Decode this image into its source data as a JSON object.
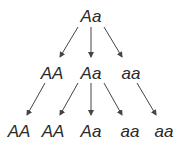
{
  "diagram": {
    "type": "genotype-inheritance-tree",
    "levels": [
      {
        "level": 0,
        "nodes": [
          {
            "id": "n0",
            "label": "Aa",
            "x": 91,
            "y": 8
          }
        ]
      },
      {
        "level": 1,
        "nodes": [
          {
            "id": "n1",
            "label": "AA",
            "x": 52,
            "y": 65
          },
          {
            "id": "n2",
            "label": "Aa",
            "x": 91,
            "y": 65
          },
          {
            "id": "n3",
            "label": "aa",
            "x": 131,
            "y": 65
          }
        ]
      },
      {
        "level": 2,
        "nodes": [
          {
            "id": "n4",
            "label": "AA",
            "x": 19,
            "y": 123
          },
          {
            "id": "n5",
            "label": "AA",
            "x": 53,
            "y": 123
          },
          {
            "id": "n6",
            "label": "Aa",
            "x": 91,
            "y": 123
          },
          {
            "id": "n7",
            "label": "aa",
            "x": 130,
            "y": 123
          },
          {
            "id": "n8",
            "label": "aa",
            "x": 164,
            "y": 123
          }
        ]
      }
    ],
    "edges": [
      {
        "from": "n0",
        "to": "n1",
        "x1": 78,
        "y1": 27,
        "x2": 60,
        "y2": 57
      },
      {
        "from": "n0",
        "to": "n2",
        "x1": 91,
        "y1": 27,
        "x2": 91,
        "y2": 57
      },
      {
        "from": "n0",
        "to": "n3",
        "x1": 104,
        "y1": 27,
        "x2": 122,
        "y2": 57
      },
      {
        "from": "n1",
        "to": "n4",
        "x1": 45,
        "y1": 83,
        "x2": 27,
        "y2": 115
      },
      {
        "from": "n2",
        "to": "n5",
        "x1": 78,
        "y1": 83,
        "x2": 60,
        "y2": 115
      },
      {
        "from": "n2",
        "to": "n6",
        "x1": 91,
        "y1": 83,
        "x2": 91,
        "y2": 115
      },
      {
        "from": "n2",
        "to": "n7",
        "x1": 104,
        "y1": 83,
        "x2": 122,
        "y2": 115
      },
      {
        "from": "n3",
        "to": "n8",
        "x1": 137,
        "y1": 83,
        "x2": 156,
        "y2": 115
      }
    ],
    "colors": {
      "text": "#2a2a2a",
      "arrow": "#444444",
      "background": "#ffffff"
    }
  }
}
